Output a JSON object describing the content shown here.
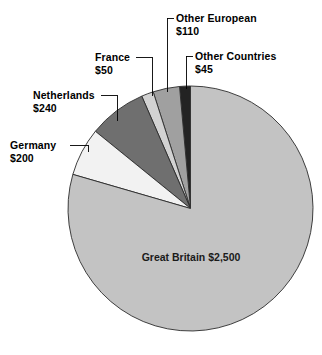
{
  "chart_data": {
    "type": "pie",
    "title": "",
    "subtitle": "",
    "xlabel": "",
    "ylabel": "",
    "currency": "$",
    "total": 3145,
    "legend_position": "none",
    "grid": false,
    "labels_placement": "callouts with leader lines",
    "start_angle_deg": 90,
    "direction": "counterclockwise",
    "categories": [
      "Great Britain",
      "Germany",
      "Netherlands",
      "France",
      "Other European",
      "Other Countries"
    ],
    "values": [
      2500,
      200,
      240,
      50,
      110,
      45
    ],
    "value_labels": [
      "$2,500",
      "$200",
      "$240",
      "$50",
      "$110",
      "$45"
    ],
    "colors": [
      "#c3c3c3",
      "#f2f2f2",
      "#6f6f6f",
      "#d2d2d2",
      "#a0a0a0",
      "#232323"
    ],
    "slices": [
      {
        "name": "Great Britain",
        "value": 2500,
        "value_label": "$2,500",
        "color": "#c3c3c3",
        "label_style": "inside"
      },
      {
        "name": "Germany",
        "value": 200,
        "value_label": "$200",
        "color": "#f2f2f2",
        "label_style": "callout"
      },
      {
        "name": "Netherlands",
        "value": 240,
        "value_label": "$240",
        "color": "#6f6f6f",
        "label_style": "callout"
      },
      {
        "name": "France",
        "value": 50,
        "value_label": "$50",
        "color": "#d2d2d2",
        "label_style": "callout"
      },
      {
        "name": "Other European",
        "value": 110,
        "value_label": "$110",
        "color": "#a0a0a0",
        "label_style": "callout"
      },
      {
        "name": "Other Countries",
        "value": 45,
        "value_label": "$45",
        "color": "#232323",
        "label_style": "callout"
      }
    ]
  },
  "labels": {
    "other_european": {
      "name": "Other European",
      "value": "$110"
    },
    "other_countries": {
      "name": "Other Countries",
      "value": "$45"
    },
    "france": {
      "name": "France",
      "value": "$50"
    },
    "netherlands": {
      "name": "Netherlands",
      "value": "$240"
    },
    "germany": {
      "name": "Germany",
      "value": "$200"
    },
    "great_britain": {
      "name": "Great Britain",
      "value": "$2,500"
    }
  }
}
